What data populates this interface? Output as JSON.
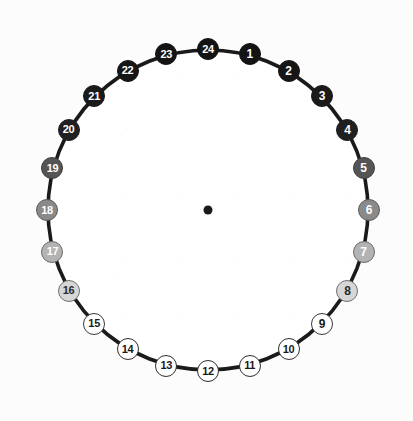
{
  "figure": {
    "type": "radial-spoke-wheel",
    "background_color": "#fcfcfd",
    "circle": {
      "center_x": 208,
      "center_y": 210,
      "radius": 160,
      "stroke_color": "#1a1a1a",
      "stroke_width": 3.6,
      "fill_color": "#ffffff"
    },
    "hub": {
      "radius": 4.5,
      "color": "#1a1a1a"
    },
    "spokes": {
      "count": 24,
      "stroke_color": "#3a3a3a",
      "stroke_width": 0.9,
      "angle_step_degrees": 15,
      "start_angle_degrees": 0
    }
  },
  "chart_data": {
    "type": "scatter",
    "title": "",
    "xlabel": "",
    "ylabel": "",
    "categories": [
      "24",
      "1",
      "2",
      "3",
      "4",
      "5",
      "6",
      "7",
      "8",
      "9",
      "10",
      "11",
      "12",
      "13",
      "14",
      "15",
      "16",
      "17",
      "18",
      "19",
      "20",
      "21",
      "22",
      "23"
    ],
    "values": [
      0,
      15,
      30,
      45,
      60,
      75,
      90,
      105,
      120,
      135,
      150,
      165,
      180,
      195,
      210,
      225,
      240,
      255,
      270,
      285,
      300,
      315,
      330,
      345
    ],
    "legend_position": "none",
    "grid": false
  },
  "nodes": [
    {
      "label": "24",
      "angle": 0,
      "fill": "#141414",
      "text_color": "#ffffff",
      "border_color": "#141414",
      "size": 22
    },
    {
      "label": "1",
      "angle": 15,
      "fill": "#141414",
      "text_color": "#ffffff",
      "border_color": "#141414",
      "size": 22
    },
    {
      "label": "2",
      "angle": 30,
      "fill": "#161616",
      "text_color": "#ffffff",
      "border_color": "#161616",
      "size": 22
    },
    {
      "label": "3",
      "angle": 45,
      "fill": "#1a1a1a",
      "text_color": "#ffffff",
      "border_color": "#1a1a1a",
      "size": 22
    },
    {
      "label": "4",
      "angle": 60,
      "fill": "#202020",
      "text_color": "#ffffff",
      "border_color": "#202020",
      "size": 22
    },
    {
      "label": "5",
      "angle": 75,
      "fill": "#555555",
      "text_color": "#ffffff",
      "border_color": "#3f3f3f",
      "size": 22
    },
    {
      "label": "6",
      "angle": 90,
      "fill": "#8a8a8a",
      "text_color": "#ffffff",
      "border_color": "#5a5a5a",
      "size": 22
    },
    {
      "label": "7",
      "angle": 105,
      "fill": "#b3b3b3",
      "text_color": "#ffffff",
      "border_color": "#6a6a6a",
      "size": 22
    },
    {
      "label": "8",
      "angle": 120,
      "fill": "#d6d6d6",
      "text_color": "#2a2a2a",
      "border_color": "#6f6f6f",
      "size": 22
    },
    {
      "label": "9",
      "angle": 135,
      "fill": "#ffffff",
      "text_color": "#1a1a1a",
      "border_color": "#3a3a3a",
      "size": 22
    },
    {
      "label": "10",
      "angle": 150,
      "fill": "#ffffff",
      "text_color": "#1a1a1a",
      "border_color": "#2e2e2e",
      "size": 22
    },
    {
      "label": "11",
      "angle": 165,
      "fill": "#ffffff",
      "text_color": "#1a1a1a",
      "border_color": "#2e2e2e",
      "size": 22
    },
    {
      "label": "12",
      "angle": 180,
      "fill": "#ffffff",
      "text_color": "#1a1a1a",
      "border_color": "#2e2e2e",
      "size": 22
    },
    {
      "label": "13",
      "angle": 195,
      "fill": "#ffffff",
      "text_color": "#1a1a1a",
      "border_color": "#2e2e2e",
      "size": 22
    },
    {
      "label": "14",
      "angle": 210,
      "fill": "#ffffff",
      "text_color": "#1a1a1a",
      "border_color": "#2e2e2e",
      "size": 22
    },
    {
      "label": "15",
      "angle": 225,
      "fill": "#ffffff",
      "text_color": "#1a1a1a",
      "border_color": "#3a3a3a",
      "size": 22
    },
    {
      "label": "16",
      "angle": 240,
      "fill": "#d6d6d6",
      "text_color": "#2a2a2a",
      "border_color": "#6f6f6f",
      "size": 22
    },
    {
      "label": "17",
      "angle": 255,
      "fill": "#b3b3b3",
      "text_color": "#ffffff",
      "border_color": "#6a6a6a",
      "size": 22
    },
    {
      "label": "18",
      "angle": 270,
      "fill": "#8a8a8a",
      "text_color": "#ffffff",
      "border_color": "#5a5a5a",
      "size": 22
    },
    {
      "label": "19",
      "angle": 285,
      "fill": "#555555",
      "text_color": "#ffffff",
      "border_color": "#3f3f3f",
      "size": 22
    },
    {
      "label": "20",
      "angle": 300,
      "fill": "#202020",
      "text_color": "#ffffff",
      "border_color": "#202020",
      "size": 22
    },
    {
      "label": "21",
      "angle": 315,
      "fill": "#1a1a1a",
      "text_color": "#ffffff",
      "border_color": "#1a1a1a",
      "size": 22
    },
    {
      "label": "22",
      "angle": 330,
      "fill": "#161616",
      "text_color": "#ffffff",
      "border_color": "#161616",
      "size": 22
    },
    {
      "label": "23",
      "angle": 345,
      "fill": "#141414",
      "text_color": "#ffffff",
      "border_color": "#141414",
      "size": 22
    }
  ]
}
